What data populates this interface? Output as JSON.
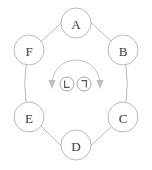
{
  "diagram": {
    "type": "ring-graph",
    "canvas": {
      "width": 152,
      "height": 170,
      "background": "#ffffff"
    },
    "style": {
      "line_color": "#b9b9b9",
      "label_color": "#3a3a3a",
      "arc_color": "#c2c2c2",
      "arrow_color": "#bdbdbd",
      "glyph_color": "#5a5a5a",
      "node_radius": 15,
      "ring_radius": 54
    },
    "nodes": [
      {
        "id": "A",
        "label": "A",
        "cx": 76,
        "cy": 23,
        "position": "top"
      },
      {
        "id": "B",
        "label": "B",
        "cx": 123,
        "cy": 50,
        "position": "upper-right"
      },
      {
        "id": "C",
        "label": "C",
        "cx": 123,
        "cy": 117,
        "position": "lower-right"
      },
      {
        "id": "D",
        "label": "D",
        "cx": 76,
        "cy": 145,
        "position": "bottom"
      },
      {
        "id": "E",
        "label": "E",
        "cx": 29,
        "cy": 117,
        "position": "lower-left"
      },
      {
        "id": "F",
        "label": "F",
        "cx": 29,
        "cy": 50,
        "position": "upper-left"
      }
    ],
    "edges": [
      {
        "from": "A",
        "to": "B"
      },
      {
        "from": "B",
        "to": "C"
      },
      {
        "from": "C",
        "to": "D"
      },
      {
        "from": "D",
        "to": "E"
      },
      {
        "from": "E",
        "to": "F"
      },
      {
        "from": "F",
        "to": "A"
      }
    ],
    "center_arc": {
      "description": "downward-opening semicircular arc with arrowheads at both ends",
      "cx": 76,
      "cy": 84,
      "radius": 24,
      "arrow_left": {
        "x": 52,
        "y": 84,
        "direction": "down"
      },
      "arrow_right": {
        "x": 100,
        "y": 84,
        "direction": "down"
      }
    },
    "center_glyphs": [
      {
        "id": "glyph-left",
        "symbol": "L",
        "cx": 67,
        "cy": 84,
        "r": 7,
        "orientation": "upright"
      },
      {
        "id": "glyph-right",
        "symbol": "L",
        "cx": 84,
        "cy": 84,
        "r": 7,
        "orientation": "rotated-180"
      }
    ]
  }
}
